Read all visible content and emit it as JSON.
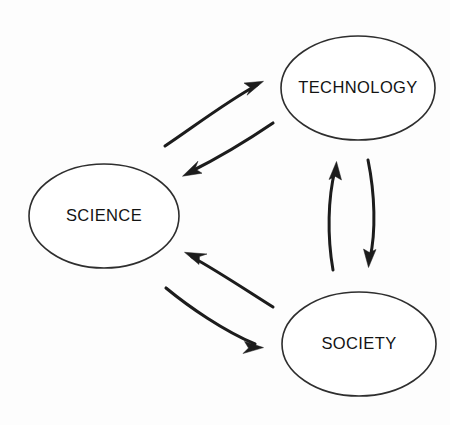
{
  "diagram": {
    "background_color": "#fdfdfd",
    "stroke_color": "#1c1c1c",
    "node_stroke_color": "#2e2e2e",
    "node_fill_color": "#ffffff",
    "text_color": "#131313",
    "nodes": [
      {
        "id": "science",
        "label": "SCIENCE",
        "cx": 104,
        "cy": 216,
        "rx": 75,
        "ry": 52
      },
      {
        "id": "technology",
        "label": "TECHNOLOGY",
        "cx": 358,
        "cy": 88,
        "rx": 77,
        "ry": 52
      },
      {
        "id": "society",
        "label": "SOCIETY",
        "cx": 359,
        "cy": 344,
        "rx": 77,
        "ry": 52
      }
    ],
    "edges": [
      {
        "id": "science-to-technology",
        "from": "SCIENCE",
        "to": "TECHNOLOGY",
        "direction": "science -> technology",
        "style": "curved-arrow"
      },
      {
        "id": "technology-to-science",
        "from": "TECHNOLOGY",
        "to": "SCIENCE",
        "direction": "technology -> science",
        "style": "curved-arrow"
      },
      {
        "id": "society-to-science",
        "from": "SOCIETY",
        "to": "SCIENCE",
        "direction": "society -> science",
        "style": "curved-arrow"
      },
      {
        "id": "science-to-society",
        "from": "SCIENCE",
        "to": "SOCIETY",
        "direction": "science -> society",
        "style": "curved-arrow"
      },
      {
        "id": "society-to-technology",
        "from": "SOCIETY",
        "to": "TECHNOLOGY",
        "direction": "society -> technology",
        "style": "curved-arrow"
      },
      {
        "id": "technology-to-society",
        "from": "TECHNOLOGY",
        "to": "SOCIETY",
        "direction": "technology -> society",
        "style": "curved-arrow"
      }
    ]
  }
}
